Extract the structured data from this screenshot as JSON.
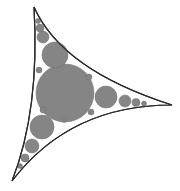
{
  "diagram": {
    "type": "apollonian-circle-packing-curved-triangle",
    "colors": {
      "background": "#ffffff",
      "fill": "#8a8a8a",
      "circle_fill": "#858585",
      "gap": "#ffffff",
      "outline": "#2a2a2a"
    },
    "vertices": [
      {
        "name": "top",
        "x": 34,
        "y": 7
      },
      {
        "name": "right",
        "x": 172,
        "y": 105
      },
      {
        "name": "bottom",
        "x": 12,
        "y": 181
      }
    ],
    "circles": [
      {
        "cx": 65,
        "cy": 93,
        "r": 29
      },
      {
        "cx": 55,
        "cy": 55,
        "r": 13
      },
      {
        "cx": 43,
        "cy": 37,
        "r": 6
      },
      {
        "cx": 40,
        "cy": 28,
        "r": 4
      },
      {
        "cx": 38,
        "cy": 21,
        "r": 2.5
      },
      {
        "cx": 106,
        "cy": 97,
        "r": 11
      },
      {
        "cx": 125,
        "cy": 101,
        "r": 6
      },
      {
        "cx": 136,
        "cy": 102.5,
        "r": 4
      },
      {
        "cx": 144,
        "cy": 103.5,
        "r": 2.5
      },
      {
        "cx": 42,
        "cy": 127,
        "r": 12
      },
      {
        "cx": 32,
        "cy": 146,
        "r": 7
      },
      {
        "cx": 25,
        "cy": 158,
        "r": 4
      },
      {
        "cx": 20,
        "cy": 166,
        "r": 2.5
      },
      {
        "cx": 89,
        "cy": 77,
        "r": 3
      },
      {
        "cx": 39,
        "cy": 70,
        "r": 3
      },
      {
        "cx": 43,
        "cy": 110,
        "r": 3
      },
      {
        "cx": 91,
        "cy": 112,
        "r": 3
      },
      {
        "cx": 64,
        "cy": 120,
        "r": 2.5
      }
    ]
  }
}
